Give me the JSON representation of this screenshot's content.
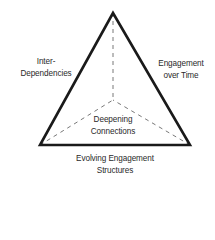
{
  "diagram": {
    "type": "triangular pyramid (top view)",
    "colors": {
      "outline": "#1a1a1a",
      "dashed": "#555555",
      "text": "#2a2a2a",
      "background": "#ffffff"
    },
    "vertices": {
      "apex": [
        113,
        13
      ],
      "left": [
        40,
        145
      ],
      "right": [
        190,
        145
      ],
      "center": [
        113,
        100
      ]
    },
    "labels": {
      "left_face": [
        "Inter-",
        "Dependencies"
      ],
      "right_face": [
        "Engagement",
        "over Time"
      ],
      "center_face": [
        "Deepening",
        "Connections"
      ],
      "bottom_edge": [
        "Evolving Engagement",
        "Structures"
      ]
    }
  }
}
